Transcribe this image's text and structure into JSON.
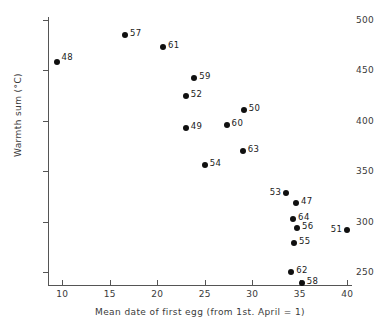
{
  "chart_data": {
    "type": "scatter",
    "title": "",
    "xlabel": "Mean date of first egg (from 1st. April = 1)",
    "ylabel": "Warmth sum (°C)",
    "xlim": [
      8.5,
      40.5
    ],
    "ylim": [
      237,
      503
    ],
    "xticks": [
      10,
      15,
      20,
      25,
      30,
      35,
      40
    ],
    "xtick_labels": [
      "10",
      "15",
      "20",
      "25",
      "30",
      "35",
      "40"
    ],
    "yticks": [
      250,
      300,
      350,
      400,
      450,
      500
    ],
    "ytick_labels": [
      "250",
      "300",
      "350",
      "400",
      "450",
      "500"
    ],
    "grid": false,
    "legend": null,
    "point_color": "#101010",
    "axis_color": "#555555",
    "points": [
      {
        "label": "48",
        "x": 9.4,
        "y": 458,
        "label_pos": "right-up"
      },
      {
        "label": "57",
        "x": 16.6,
        "y": 485,
        "label_pos": "right"
      },
      {
        "label": "61",
        "x": 20.6,
        "y": 473,
        "label_pos": "right"
      },
      {
        "label": "59",
        "x": 23.9,
        "y": 442,
        "label_pos": "right"
      },
      {
        "label": "52",
        "x": 23.0,
        "y": 425,
        "label_pos": "right"
      },
      {
        "label": "50",
        "x": 29.1,
        "y": 411,
        "label_pos": "right"
      },
      {
        "label": "60",
        "x": 27.3,
        "y": 396,
        "label_pos": "right"
      },
      {
        "label": "49",
        "x": 23.0,
        "y": 393,
        "label_pos": "right"
      },
      {
        "label": "63",
        "x": 29.0,
        "y": 370,
        "label_pos": "right"
      },
      {
        "label": "54",
        "x": 25.0,
        "y": 356,
        "label_pos": "right"
      },
      {
        "label": "53",
        "x": 33.6,
        "y": 328,
        "label_pos": "left"
      },
      {
        "label": "47",
        "x": 34.6,
        "y": 318,
        "label_pos": "right"
      },
      {
        "label": "64",
        "x": 34.3,
        "y": 303,
        "label_pos": "right"
      },
      {
        "label": "56",
        "x": 34.7,
        "y": 294,
        "label_pos": "right"
      },
      {
        "label": "55",
        "x": 34.4,
        "y": 279,
        "label_pos": "right"
      },
      {
        "label": "51",
        "x": 40.0,
        "y": 292,
        "label_pos": "left"
      },
      {
        "label": "62",
        "x": 34.1,
        "y": 250,
        "label_pos": "right"
      },
      {
        "label": "58",
        "x": 35.2,
        "y": 239,
        "label_pos": "right"
      }
    ]
  }
}
